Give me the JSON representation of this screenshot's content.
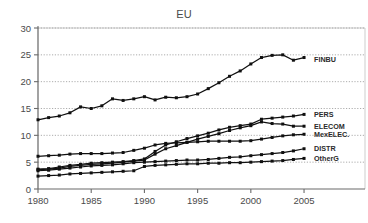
{
  "chart_data": {
    "type": "line",
    "title": "EU",
    "xlabel": "",
    "ylabel": "",
    "xlim": [
      1980,
      2006.5
    ],
    "ylim": [
      0,
      30
    ],
    "xticks": [
      1980,
      1985,
      1990,
      1995,
      2000,
      2005
    ],
    "yticks": [
      0,
      5,
      10,
      15,
      20,
      25,
      30
    ],
    "grid": true,
    "legend_position": "right-inline",
    "x": [
      1980,
      1981,
      1982,
      1983,
      1984,
      1985,
      1986,
      1987,
      1988,
      1989,
      1990,
      1991,
      1992,
      1993,
      1994,
      1995,
      1996,
      1997,
      1998,
      1999,
      2000,
      2001,
      2002,
      2003,
      2004,
      2005
    ],
    "series": [
      {
        "name": "FINBU",
        "values": [
          12.9,
          13.3,
          13.6,
          14.2,
          15.3,
          15.0,
          15.5,
          16.8,
          16.5,
          16.8,
          17.2,
          16.6,
          17.1,
          17.0,
          17.2,
          17.7,
          18.7,
          19.8,
          21.0,
          22.0,
          23.3,
          24.5,
          24.9,
          25.0,
          24.0,
          24.5
        ]
      },
      {
        "name": "PERS",
        "values": [
          3.7,
          3.8,
          4.1,
          4.4,
          4.6,
          4.8,
          4.9,
          5.0,
          5.1,
          5.3,
          5.6,
          7.0,
          8.2,
          8.8,
          9.4,
          9.9,
          10.4,
          11.0,
          11.5,
          11.8,
          12.1,
          13.0,
          13.2,
          13.4,
          13.6,
          13.9
        ]
      },
      {
        "name": "ELECOM",
        "values": [
          3.6,
          3.7,
          3.9,
          4.2,
          4.4,
          4.6,
          4.7,
          4.8,
          5.0,
          5.2,
          5.4,
          6.5,
          7.5,
          8.1,
          8.7,
          9.3,
          9.8,
          10.3,
          10.9,
          11.4,
          11.8,
          12.5,
          12.2,
          12.1,
          11.7,
          11.7
        ]
      },
      {
        "name": "MexELEC.",
        "values": [
          6.1,
          6.2,
          6.3,
          6.5,
          6.6,
          6.6,
          6.6,
          6.7,
          6.8,
          7.2,
          7.6,
          8.2,
          8.5,
          8.6,
          8.7,
          8.8,
          8.9,
          8.9,
          8.9,
          8.9,
          9.0,
          9.3,
          9.6,
          9.9,
          10.1,
          10.2
        ]
      },
      {
        "name": "DISTR",
        "values": [
          3.4,
          3.5,
          3.7,
          3.9,
          4.1,
          4.3,
          4.4,
          4.5,
          4.7,
          4.9,
          5.0,
          5.1,
          5.2,
          5.3,
          5.4,
          5.4,
          5.5,
          5.7,
          5.9,
          6.0,
          6.2,
          6.4,
          6.6,
          6.8,
          7.1,
          7.5
        ]
      },
      {
        "name": "OtherG",
        "values": [
          2.4,
          2.5,
          2.6,
          2.8,
          2.9,
          3.0,
          3.1,
          3.2,
          3.3,
          3.4,
          4.2,
          4.4,
          4.5,
          4.6,
          4.7,
          4.7,
          4.8,
          4.8,
          4.9,
          4.9,
          5.0,
          5.1,
          5.2,
          5.3,
          5.5,
          5.7
        ]
      }
    ]
  },
  "legend": {
    "items": [
      {
        "label": "FINBU"
      },
      {
        "label": "PERS"
      },
      {
        "label": "ELECOM"
      },
      {
        "label": "MexELEC."
      },
      {
        "label": "DISTR"
      },
      {
        "label": "OtherG"
      }
    ]
  }
}
